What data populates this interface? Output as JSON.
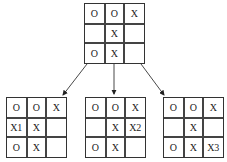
{
  "root": {
    "cells": [
      "O",
      "O",
      "X",
      "",
      "X",
      "",
      "O",
      "X",
      ""
    ]
  },
  "children": [
    {
      "cells": [
        "O",
        "O",
        "X",
        "X1",
        "X",
        "",
        "O",
        "X",
        ""
      ]
    },
    {
      "cells": [
        "O",
        "O",
        "X",
        "",
        "X",
        "X2",
        "O",
        "X",
        ""
      ]
    },
    {
      "cells": [
        "O",
        "O",
        "X",
        "",
        "X",
        "",
        "O",
        "X",
        "X3"
      ]
    }
  ],
  "colors": {
    "line": "#333333",
    "text": "#222222"
  }
}
